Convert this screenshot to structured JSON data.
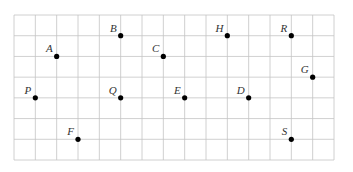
{
  "diagram": {
    "type": "lattice-points",
    "grid": {
      "columns": 15,
      "rows": 7,
      "line_color": "#c4c4c4"
    },
    "point_color": "#000000",
    "points": [
      {
        "label": "A",
        "col": 2,
        "row": 2
      },
      {
        "label": "B",
        "col": 5,
        "row": 1
      },
      {
        "label": "C",
        "col": 7,
        "row": 2
      },
      {
        "label": "H",
        "col": 10,
        "row": 1
      },
      {
        "label": "R",
        "col": 13,
        "row": 1
      },
      {
        "label": "G",
        "col": 14,
        "row": 3
      },
      {
        "label": "P",
        "col": 1,
        "row": 4
      },
      {
        "label": "Q",
        "col": 5,
        "row": 4
      },
      {
        "label": "E",
        "col": 8,
        "row": 4
      },
      {
        "label": "D",
        "col": 11,
        "row": 4
      },
      {
        "label": "F",
        "col": 3,
        "row": 6
      },
      {
        "label": "S",
        "col": 13,
        "row": 6
      }
    ]
  }
}
